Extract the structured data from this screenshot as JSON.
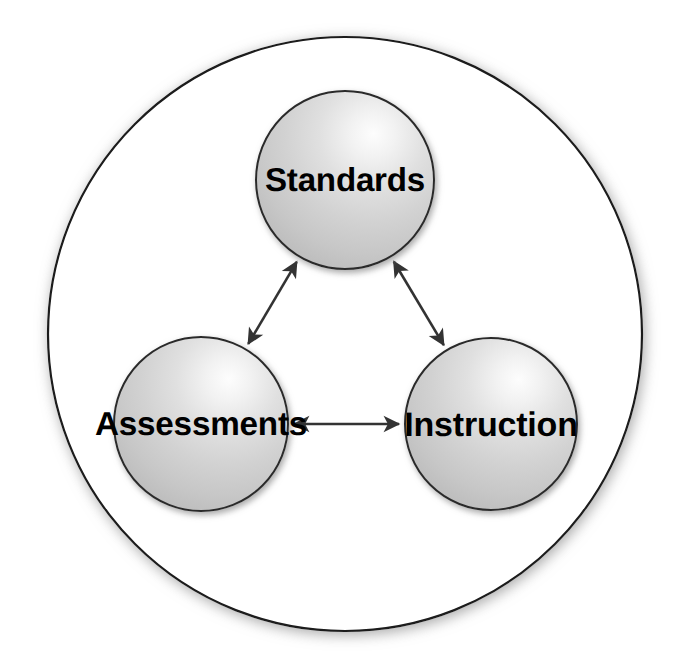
{
  "diagram": {
    "type": "triangle-relationship-diagram",
    "container": {
      "shape": "circle",
      "name": "outer-boundary-circle",
      "fill": "#ffffff",
      "stroke": "#1a1a1a",
      "stroke_width": 2.2,
      "center_x": 345,
      "center_y": 334,
      "radius": 297,
      "shadow_color": "#b0b0b0"
    },
    "nodes": [
      {
        "id": "standards",
        "label": "Standards",
        "center_x": 345,
        "center_y": 180,
        "radius": 89,
        "fill_light": "#fafafa",
        "fill_dark": "#c2c2c2",
        "stroke": "#2b2b2b",
        "text_color": "#000000"
      },
      {
        "id": "assessments",
        "label": "Assessments",
        "center_x": 201,
        "center_y": 424,
        "radius": 87,
        "fill_light": "#fafafa",
        "fill_dark": "#c2c2c2",
        "stroke": "#2b2b2b",
        "text_color": "#000000"
      },
      {
        "id": "instruction",
        "label": "Instruction",
        "center_x": 491,
        "center_y": 424,
        "radius": 86,
        "fill_light": "#fafafa",
        "fill_dark": "#c2c2c2",
        "stroke": "#2b2b2b",
        "text_color": "#000000"
      }
    ],
    "connectors": [
      {
        "id": "standards-assessments",
        "from": "standards",
        "to": "assessments",
        "style": "double-headed-arrow",
        "color": "#333333"
      },
      {
        "id": "standards-instruction",
        "from": "standards",
        "to": "instruction",
        "style": "double-headed-arrow",
        "color": "#333333"
      },
      {
        "id": "assessments-instruction",
        "from": "assessments",
        "to": "instruction",
        "style": "double-headed-arrow",
        "color": "#333333"
      }
    ]
  }
}
